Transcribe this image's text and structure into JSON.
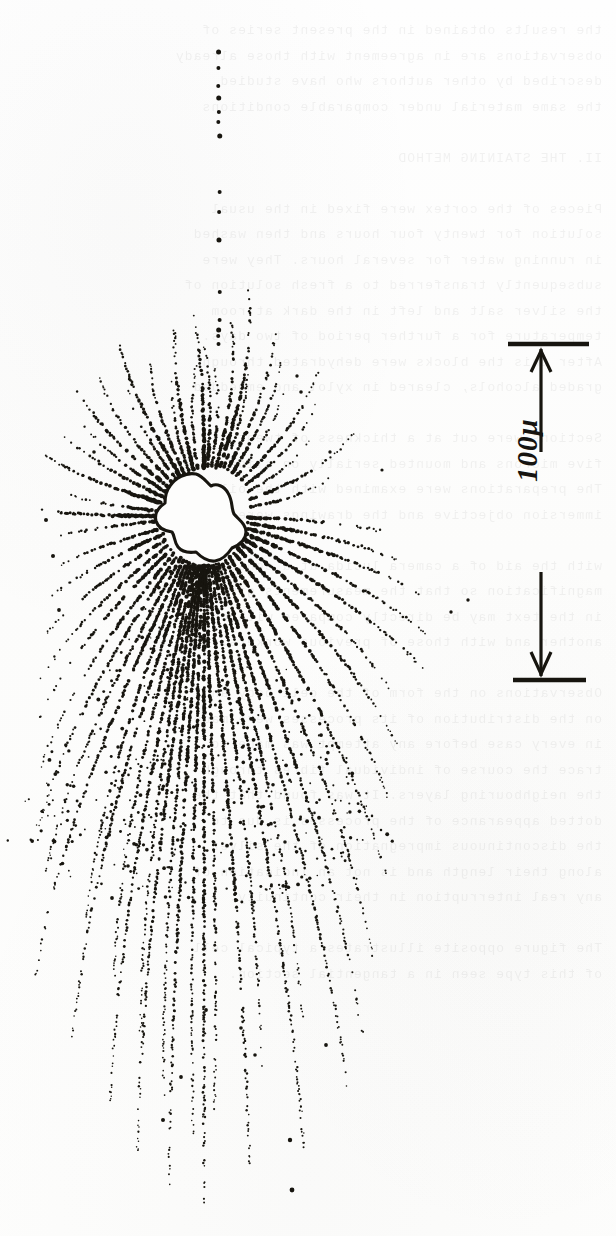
{
  "figure": {
    "kind": "camera-lucida drawing of a cell (soma) with radiating dotted processes",
    "caption_text": "",
    "background_color": "#fdfdfc",
    "ink_color": "#17150f"
  },
  "scale_bar": {
    "label": "100μ",
    "value": "100",
    "unit": "μ",
    "orientation": "vertical",
    "label_rotation_deg": -90,
    "arrowheads": "double (up and down)",
    "top_cap_y": 344,
    "bottom_cap_y": 680,
    "axis_x": 541,
    "length_px": 336
  },
  "cell": {
    "soma_center_x": 204,
    "soma_center_y": 516,
    "soma_fill": "#fdfdfc",
    "soma_outline": "#17150f",
    "process_style": "dotted / dashed stipple",
    "process_count_visible": 46
  },
  "bleed_through": {
    "visible": true,
    "description": "faint mirrored text showing through from the reverse side of the page",
    "lines": [
      "the results obtained in the present series of",
      "observations are in agreement with those already",
      "described by other authors who have studied",
      "the same material under comparable conditions",
      "",
      "II. THE STAINING METHOD",
      "",
      "Pieces of the cortex were fixed in the usual",
      "solution for twenty four hours and then washed",
      "in running water for several hours. They were",
      "subsequently transferred to a fresh solution of",
      "the silver salt and left in the dark at room",
      "temperature for a further period of two days.",
      "After this the blocks were dehydrated through",
      "graded alcohols, cleared in xylol and embedded",
      "",
      "Sections were cut at a thickness of twenty",
      "five microns and mounted serially on slides.",
      "The preparations were examined with the oil",
      "immersion objective and the drawings were made",
      "",
      "with the aid of a camera lucida at a constant",
      "magnification so that the measurements given",
      "in the text may be directly compared with one",
      "another and with those of previous workers.",
      "",
      "Observations on the form of the cell body and",
      "on the distribution of its processes were made",
      "in every case before any attempt was made to",
      "trace the course of individual fibres through",
      "the neighbouring layers. It was found that the",
      "dotted appearance of the processes is due to",
      "the discontinuous impregnation of the silver",
      "along their length and is not an indication of",
      "any real interruption in their continuity.",
      "",
      "The figure opposite illustrates a typical cell",
      "of this type seen in a tangential section."
    ]
  }
}
